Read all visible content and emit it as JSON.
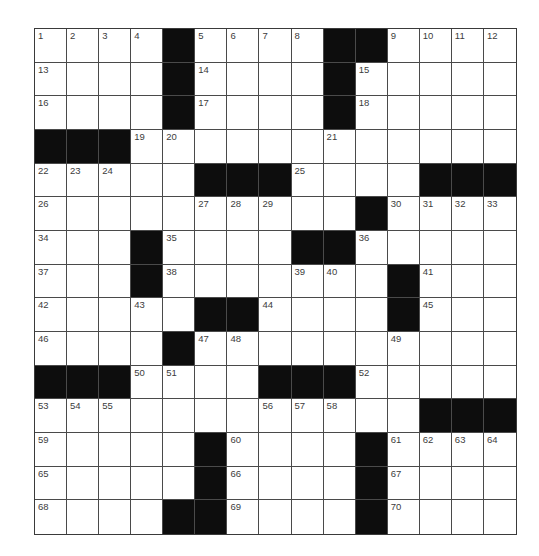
{
  "puzzle": {
    "rows": 15,
    "cols": 15,
    "colors": {
      "block": "#0d0d0d",
      "cell": "#ffffff",
      "grid_line": "#4a4a4a",
      "number": "#3c3c3c"
    },
    "grid": [
      [
        "1",
        "2",
        "3",
        "4",
        "#",
        "5",
        "6",
        "7",
        "8",
        "#",
        "#",
        "9",
        "10",
        "11",
        "12"
      ],
      [
        "13",
        "",
        "",
        "",
        "#",
        "14",
        "",
        "",
        "",
        "#",
        "15",
        "",
        "",
        "",
        ""
      ],
      [
        "16",
        "",
        "",
        "",
        "#",
        "17",
        "",
        "",
        "",
        "#",
        "18",
        "",
        "",
        "",
        ""
      ],
      [
        "#",
        "#",
        "#",
        "19",
        "20",
        "",
        "",
        "",
        "",
        "21",
        "",
        "",
        "",
        "",
        ""
      ],
      [
        "22",
        "23",
        "24",
        "",
        "",
        "#",
        "#",
        "#",
        "25",
        "",
        "",
        "",
        "#",
        "#",
        "#"
      ],
      [
        "26",
        "",
        "",
        "",
        "",
        "27",
        "28",
        "29",
        "",
        "",
        "#",
        "30",
        "31",
        "32",
        "33"
      ],
      [
        "34",
        "",
        "",
        "#",
        "35",
        "",
        "",
        "",
        "#",
        "#",
        "36",
        "",
        "",
        "",
        ""
      ],
      [
        "37",
        "",
        "",
        "#",
        "38",
        "",
        "",
        "",
        "39",
        "40",
        "",
        "#",
        "41",
        "",
        ""
      ],
      [
        "42",
        "",
        "",
        "43",
        "",
        "#",
        "#",
        "44",
        "",
        "",
        "",
        "#",
        "45",
        "",
        ""
      ],
      [
        "46",
        "",
        "",
        "",
        "#",
        "47",
        "48",
        "",
        "",
        "",
        "",
        "49",
        "",
        "",
        ""
      ],
      [
        "#",
        "#",
        "#",
        "50",
        "51",
        "",
        "",
        "#",
        "#",
        "#",
        "52",
        "",
        "",
        "",
        ""
      ],
      [
        "53",
        "54",
        "55",
        "",
        "",
        "",
        "",
        "56",
        "57",
        "58",
        "",
        "",
        "#",
        "#",
        "#"
      ],
      [
        "59",
        "",
        "",
        "",
        "",
        "#",
        "60",
        "",
        "",
        "",
        "#",
        "61",
        "62",
        "63",
        "64"
      ],
      [
        "65",
        "",
        "",
        "",
        "",
        "#",
        "66",
        "",
        "",
        "",
        "#",
        "67",
        "",
        "",
        ""
      ],
      [
        "68",
        "",
        "",
        "",
        "#",
        "#",
        "69",
        "",
        "",
        "",
        "#",
        "70",
        "",
        "",
        ""
      ]
    ],
    "letters": []
  }
}
